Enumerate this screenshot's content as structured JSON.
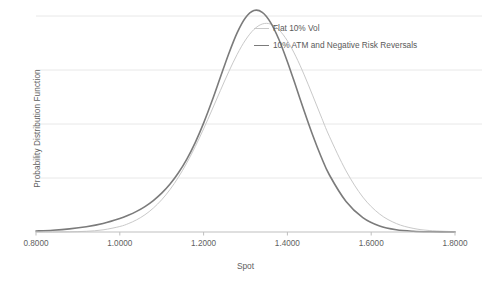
{
  "chart_data": {
    "type": "line",
    "title": "",
    "xlabel": "Spot",
    "ylabel": "Probability Distribution Function",
    "xlim": [
      0.8,
      1.8
    ],
    "ylim": [
      0,
      4.32
    ],
    "xticks": [
      0.8,
      1.0,
      1.2,
      1.4,
      1.6,
      1.8
    ],
    "xticklabels": [
      "0.8000",
      "1.0000",
      "1.2000",
      "1.4000",
      "1.6000",
      "1.8000"
    ],
    "yticklabels": [],
    "grid": "horizontal",
    "legend_position": "top-right",
    "series": [
      {
        "name": "Flat 10% Vol",
        "color": "#c9c9c9",
        "width": 1.0,
        "peak_x": 1.262,
        "peak_y": 3.93,
        "x": [
          0.8,
          0.84,
          0.88,
          0.92,
          0.96,
          1.0,
          1.02,
          1.04,
          1.06,
          1.08,
          1.1,
          1.12,
          1.14,
          1.16,
          1.18,
          1.2,
          1.22,
          1.24,
          1.26,
          1.28,
          1.3,
          1.32,
          1.34,
          1.36,
          1.38,
          1.4,
          1.42,
          1.44,
          1.46,
          1.48,
          1.5,
          1.54,
          1.58,
          1.62,
          1.66,
          1.7,
          1.74,
          1.8
        ],
        "y": [
          0.0,
          0.001,
          0.004,
          0.014,
          0.043,
          0.11,
          0.166,
          0.243,
          0.345,
          0.478,
          0.645,
          0.851,
          1.097,
          1.383,
          1.707,
          2.063,
          2.441,
          2.828,
          3.205,
          3.551,
          3.84,
          4.05,
          4.16,
          4.158,
          4.043,
          3.823,
          3.515,
          3.144,
          2.737,
          2.32,
          1.916,
          1.222,
          0.698,
          0.36,
          0.169,
          0.073,
          0.029,
          0.006
        ]
      },
      {
        "name": "10% ATM and Negative Risk Reversals",
        "color": "#7b7b7b",
        "width": 1.6,
        "peak_x": 1.283,
        "peak_y": 4.32,
        "x": [
          0.8,
          0.84,
          0.88,
          0.92,
          0.96,
          1.0,
          1.02,
          1.04,
          1.06,
          1.08,
          1.1,
          1.12,
          1.14,
          1.16,
          1.18,
          1.2,
          1.22,
          1.24,
          1.26,
          1.28,
          1.3,
          1.32,
          1.34,
          1.36,
          1.38,
          1.4,
          1.42,
          1.44,
          1.46,
          1.48,
          1.5,
          1.54,
          1.58,
          1.62,
          1.66,
          1.7,
          1.74,
          1.8
        ],
        "y": [
          0.019,
          0.035,
          0.062,
          0.105,
          0.17,
          0.268,
          0.333,
          0.412,
          0.509,
          0.629,
          0.777,
          0.96,
          1.185,
          1.459,
          1.789,
          2.177,
          2.618,
          3.093,
          3.566,
          3.983,
          4.285,
          4.429,
          4.394,
          4.189,
          3.846,
          3.407,
          2.918,
          2.42,
          1.945,
          1.516,
          1.145,
          0.61,
          0.288,
          0.12,
          0.044,
          0.014,
          0.004,
          0.0
        ]
      }
    ],
    "gridline_values": [
      4.32,
      3.24,
      2.16,
      1.08,
      0.0
    ]
  },
  "axes": {
    "x_axis_line_color": "#bfbfbf",
    "gridline_color": "#e8e8e8"
  },
  "legend": {
    "items": [
      {
        "label": "Flat 10% Vol",
        "swatch": "light"
      },
      {
        "label": "10% ATM and Negative Risk Reversals",
        "swatch": "dark"
      }
    ]
  }
}
